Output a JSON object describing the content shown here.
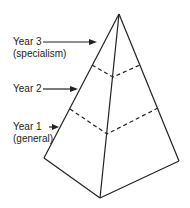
{
  "diagram": {
    "type": "pyramid",
    "stroke_color": "#222222",
    "levels": [
      {
        "id": "year3",
        "label": "Year 3",
        "sublabel": "(specialism)"
      },
      {
        "id": "year2",
        "label": "Year 2",
        "sublabel": ""
      },
      {
        "id": "year1",
        "label": "Year 1",
        "sublabel": "(general)"
      }
    ]
  }
}
